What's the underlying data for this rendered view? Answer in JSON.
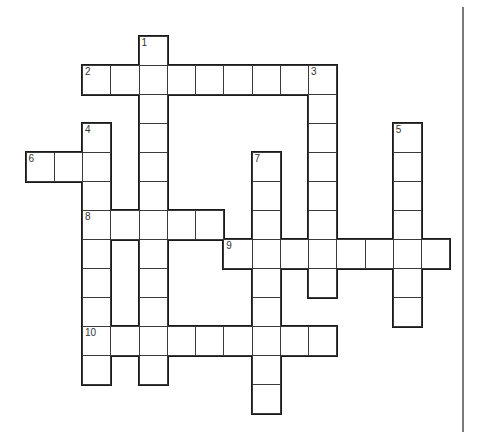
{
  "puzzle": {
    "cell": {
      "x0": 26,
      "y0": 36,
      "w": 28.25,
      "h": 29
    },
    "colors": {
      "outline": "#1a1a1a",
      "inner_line": "#3a3a3a",
      "divider": "#7a7a7a",
      "background": "#ffffff"
    },
    "entries": [
      {
        "number": "1",
        "direction": "down",
        "row": 0,
        "col": 4,
        "length": 12
      },
      {
        "number": "2",
        "direction": "across",
        "row": 1,
        "col": 2,
        "length": 9
      },
      {
        "number": "3",
        "direction": "down",
        "row": 1,
        "col": 10,
        "length": 8
      },
      {
        "number": "4",
        "direction": "down",
        "row": 3,
        "col": 2,
        "length": 9
      },
      {
        "number": "5",
        "direction": "down",
        "row": 3,
        "col": 13,
        "length": 7
      },
      {
        "number": "6",
        "direction": "across",
        "row": 4,
        "col": 0,
        "length": 3
      },
      {
        "number": "7",
        "direction": "down",
        "row": 4,
        "col": 8,
        "length": 9
      },
      {
        "number": "8",
        "direction": "across",
        "row": 6,
        "col": 2,
        "length": 5
      },
      {
        "number": "9",
        "direction": "across",
        "row": 7,
        "col": 7,
        "length": 8
      },
      {
        "number": "10",
        "direction": "across",
        "row": 10,
        "col": 2,
        "length": 9
      }
    ]
  }
}
